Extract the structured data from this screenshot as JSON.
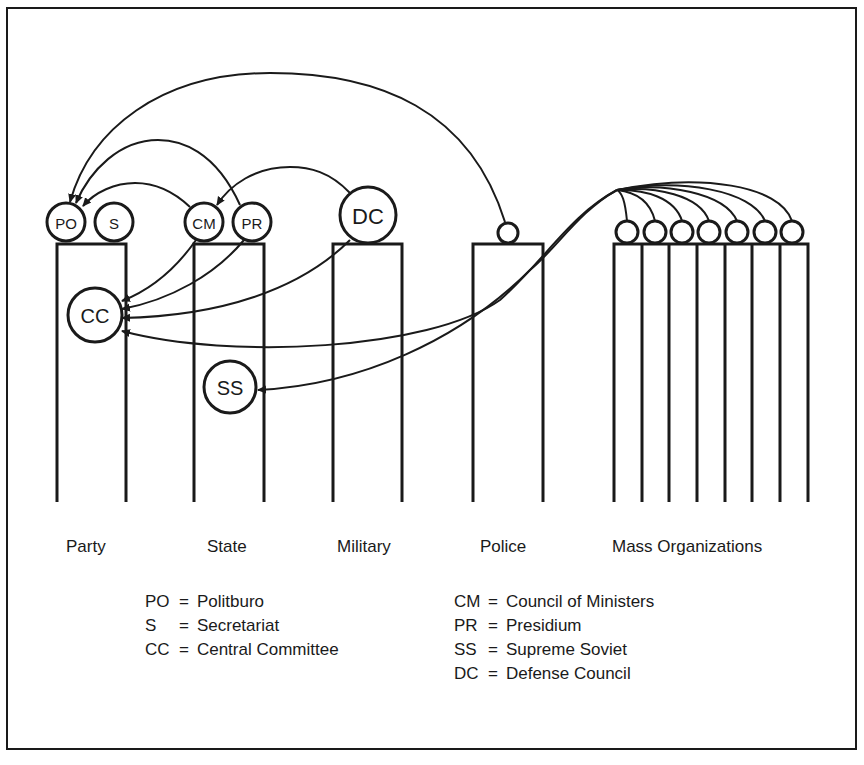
{
  "colors": {
    "ink": "#1a1a1a",
    "background": "#ffffff"
  },
  "columns": [
    {
      "id": "party",
      "label": "Party",
      "label_x": 80
    },
    {
      "id": "state",
      "label": "State",
      "label_x": 207
    },
    {
      "id": "military",
      "label": "Military",
      "label_x": 338
    },
    {
      "id": "police",
      "label": "Police",
      "label_x": 481
    },
    {
      "id": "mass_organizations",
      "label": "Mass Organizations",
      "label_x": 612
    }
  ],
  "nodes": {
    "PO": {
      "label": "PO",
      "column": "party"
    },
    "S": {
      "label": "S",
      "column": "party"
    },
    "CC": {
      "label": "CC",
      "column": "party"
    },
    "CM": {
      "label": "CM",
      "column": "state"
    },
    "PR": {
      "label": "PR",
      "column": "state"
    },
    "SS": {
      "label": "SS",
      "column": "state"
    },
    "DC": {
      "label": "DC",
      "column": "military"
    },
    "police_unit": {
      "label": "",
      "column": "police"
    },
    "mass_org_units": {
      "count": 7,
      "label": "",
      "column": "mass_organizations"
    }
  },
  "edges": [
    {
      "from": "police_unit",
      "to": "PO"
    },
    {
      "from": "PR",
      "to": "PO"
    },
    {
      "from": "CM",
      "to": "PO"
    },
    {
      "from": "DC",
      "to": "CM"
    },
    {
      "from": "CM",
      "to": "CC"
    },
    {
      "from": "PR",
      "to": "CC"
    },
    {
      "from": "DC",
      "to": "CC"
    },
    {
      "from": "mass_org_units",
      "to": "CC"
    },
    {
      "from": "mass_org_units",
      "to": "SS"
    }
  ],
  "legend": {
    "left": [
      {
        "abbr": "PO",
        "eq": "=",
        "meaning": "Politburo"
      },
      {
        "abbr": "S",
        "eq": "=",
        "meaning": "Secretariat"
      },
      {
        "abbr": "CC",
        "eq": "=",
        "meaning": "Central Committee"
      }
    ],
    "right": [
      {
        "abbr": "CM",
        "eq": "=",
        "meaning": "Council of Ministers"
      },
      {
        "abbr": "PR",
        "eq": "=",
        "meaning": "Presidium"
      },
      {
        "abbr": "SS",
        "eq": "=",
        "meaning": "Supreme Soviet"
      },
      {
        "abbr": "DC",
        "eq": "=",
        "meaning": "Defense Council"
      }
    ]
  }
}
